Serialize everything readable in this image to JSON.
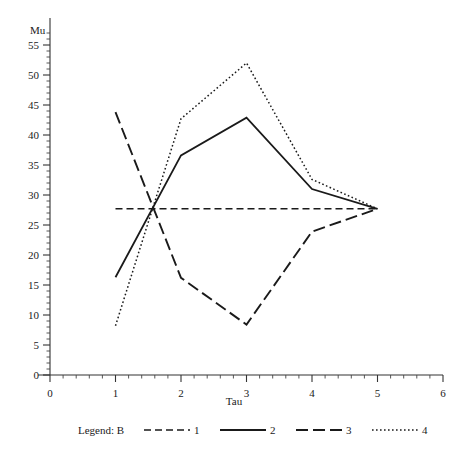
{
  "chart_data": {
    "type": "line",
    "title": "",
    "xlabel": "Tau",
    "ylabel": "Mu",
    "xlim": [
      0,
      6
    ],
    "ylim": [
      0,
      57.5
    ],
    "grid": false,
    "legend_position": "bottom",
    "legend_title": "Legend: B",
    "x_ticks": [
      "0",
      "1",
      "2",
      "3",
      "4",
      "5",
      "6"
    ],
    "x_tick_values": [
      0,
      1,
      2,
      3,
      4,
      5,
      6
    ],
    "y_ticks": [
      "0",
      "5",
      "10",
      "15",
      "20",
      "25",
      "30",
      "35",
      "40",
      "45",
      "50",
      "55"
    ],
    "y_tick_values": [
      0,
      5,
      10,
      15,
      20,
      25,
      30,
      35,
      40,
      45,
      50,
      55
    ],
    "x": [
      1,
      2,
      3,
      4,
      5
    ],
    "series": [
      {
        "name": "1",
        "label": "1",
        "style": "short-dash",
        "dasharray": "7,4",
        "width": 1.6,
        "color": "#1a1a1a",
        "values": [
          27.7,
          27.7,
          27.7,
          27.7,
          27.7
        ]
      },
      {
        "name": "2",
        "label": "2",
        "style": "solid",
        "dasharray": "",
        "width": 1.8,
        "color": "#1a1a1a",
        "values": [
          16.3,
          36.6,
          42.9,
          31.0,
          27.7
        ]
      },
      {
        "name": "3",
        "label": "3",
        "style": "long-dash",
        "dasharray": "12,5",
        "width": 1.9,
        "color": "#1a1a1a",
        "values": [
          43.8,
          16.2,
          8.4,
          23.9,
          27.7
        ]
      },
      {
        "name": "4",
        "label": "4",
        "style": "dotted",
        "dasharray": "1.6,2.4",
        "width": 1.5,
        "color": "#1a1a1a",
        "values": [
          8.2,
          42.7,
          52.0,
          32.6,
          27.7
        ]
      }
    ]
  },
  "legend": {
    "title": "Legend: B",
    "entries": [
      {
        "label": "1",
        "style": "short-dash"
      },
      {
        "label": "2",
        "style": "solid"
      },
      {
        "label": "3",
        "style": "long-dash"
      },
      {
        "label": "4",
        "style": "dotted"
      }
    ]
  }
}
